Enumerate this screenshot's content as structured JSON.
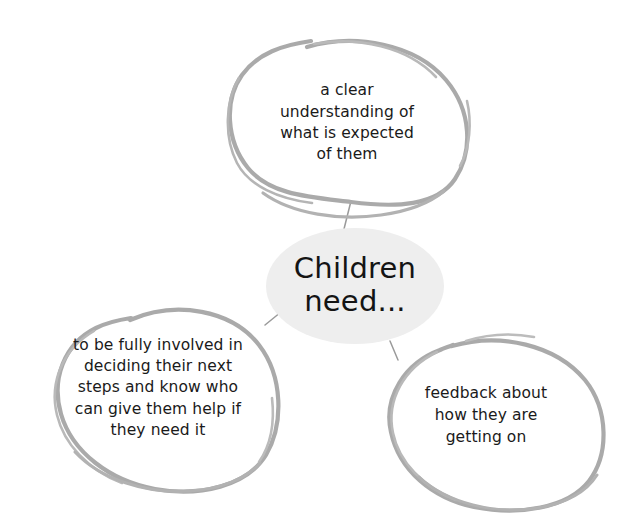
{
  "diagram": {
    "title": "Children need...",
    "type": "mind-map",
    "style": "hand-drawn sketch",
    "background_color": "#ffffff",
    "stroke_color": "#aaaaaa",
    "hub_fill_color": "#eeeeee",
    "text_color": "#1a1a1a",
    "hub": {
      "label": "Children\nneed...",
      "shape": "ellipse"
    },
    "branches": [
      {
        "id": "expectations",
        "label": "a clear\nunderstanding of\nwhat is expected\nof them",
        "shape": "hand-drawn-ellipse",
        "position": "top"
      },
      {
        "id": "involvement",
        "label": "to be fully involved in\ndeciding their next\nsteps and know who\ncan give them help if\nthey need it",
        "shape": "hand-drawn-ellipse",
        "position": "bottom-left"
      },
      {
        "id": "feedback",
        "label": "feedback about\nhow they are\ngetting on",
        "shape": "hand-drawn-ellipse",
        "position": "bottom-right"
      }
    ],
    "connectors": [
      {
        "id": "hub-to-expectations",
        "from": "hub",
        "to": "expectations"
      },
      {
        "id": "hub-to-involvement",
        "from": "hub",
        "to": "involvement"
      },
      {
        "id": "hub-to-feedback",
        "from": "hub",
        "to": "feedback"
      }
    ]
  }
}
